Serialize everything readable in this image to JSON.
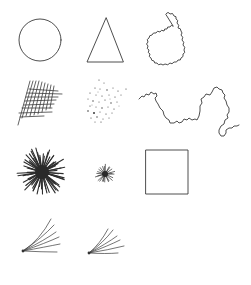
{
  "figure": {
    "background": "#ffffff",
    "ink_color": "#3a3a3a",
    "layout": {
      "rows": 4,
      "columns": 3
    },
    "shapes": [
      {
        "id": "circle",
        "row": 1,
        "col": 1,
        "type": "circle",
        "cx": 40,
        "cy": 40,
        "r": 21
      },
      {
        "id": "triangle",
        "row": 1,
        "col": 2,
        "type": "triangle",
        "points": [
          [
            106,
            18
          ],
          [
            87,
            62
          ],
          [
            123,
            62
          ]
        ]
      },
      {
        "id": "scalloped-blob",
        "row": 1,
        "col": 3,
        "type": "scalloped-closed-curve"
      },
      {
        "id": "crosshatch",
        "row": 2,
        "col": 1,
        "type": "crosshatch-grid"
      },
      {
        "id": "dot-scatter",
        "row": 2,
        "col": 2,
        "type": "scattered-dots"
      },
      {
        "id": "wandering-line",
        "row": 2,
        "col": 3,
        "type": "irregular-open-line"
      },
      {
        "id": "large-starburst",
        "row": 3,
        "col": 1,
        "type": "starburst",
        "cx": 42,
        "cy": 172,
        "r": 25
      },
      {
        "id": "small-starburst",
        "row": 3,
        "col": 2,
        "type": "starburst",
        "cx": 105,
        "cy": 174,
        "r": 10
      },
      {
        "id": "square",
        "row": 3,
        "col": 3,
        "type": "square",
        "x": 146,
        "y": 150,
        "w": 42,
        "h": 44
      },
      {
        "id": "fan-curves-1",
        "row": 4,
        "col": 1,
        "type": "fan-of-curves"
      },
      {
        "id": "fan-curves-2",
        "row": 4,
        "col": 2,
        "type": "fan-of-curves"
      }
    ]
  }
}
